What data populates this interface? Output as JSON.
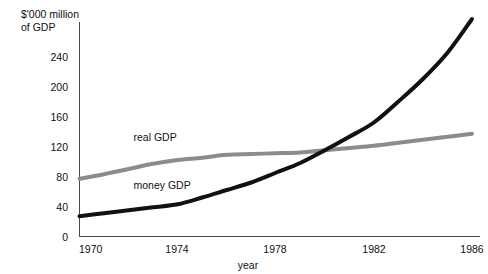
{
  "chart_data": {
    "type": "line",
    "title": "",
    "ylabel": "$'000 million\nof GDP",
    "ylabel_line1": "$'000 million",
    "ylabel_line2": "of GDP",
    "xlabel": "year",
    "xlim": [
      1970,
      1986
    ],
    "ylim": [
      0,
      260
    ],
    "grid": false,
    "legend_position": "inline-annotations",
    "yticks": [
      0,
      40,
      80,
      120,
      160,
      200,
      240
    ],
    "ytick_labels": [
      "0",
      "40",
      "80",
      "120",
      "160",
      "200",
      "240"
    ],
    "xticks": [
      1970,
      1974,
      1978,
      1982,
      1986
    ],
    "xtick_labels": [
      "1970",
      "1974",
      "1978",
      "1982",
      "1986"
    ],
    "x": [
      1970,
      1971,
      1972,
      1973,
      1974,
      1975,
      1976,
      1977,
      1978,
      1979,
      1980,
      1981,
      1982,
      1983,
      1984,
      1985,
      1986
    ],
    "series": [
      {
        "name": "real GDP",
        "color": "#8c8c8c",
        "line_width": 4.0,
        "label_x": 1972.2,
        "label_y": 127,
        "values": [
          77,
          83,
          90,
          97,
          102,
          105,
          109,
          110,
          111,
          112,
          115,
          118,
          121,
          125,
          129,
          133,
          137
        ]
      },
      {
        "name": "money GDP",
        "color": "#111111",
        "line_width": 4.0,
        "label_x": 1972.2,
        "label_y": 64,
        "values": [
          27,
          31,
          35,
          39,
          43,
          52,
          62,
          72,
          85,
          98,
          115,
          133,
          152,
          180,
          210,
          245,
          290
        ]
      }
    ],
    "annotations": []
  }
}
